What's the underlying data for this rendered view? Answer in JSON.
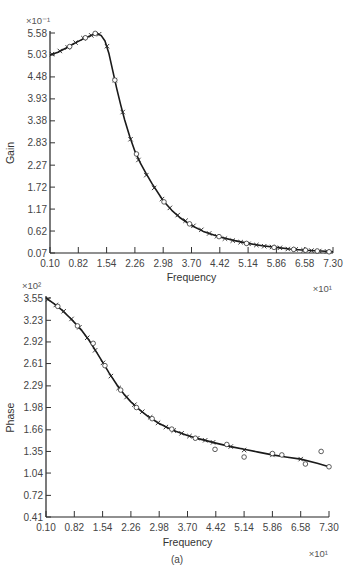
{
  "caption": "(a)",
  "chart_data": [
    {
      "type": "line",
      "title": "",
      "xlabel": "Frequency",
      "ylabel": "Gain",
      "x_multiplier": "×10¹",
      "y_multiplier": "×10⁻¹",
      "xlim": [
        0.1,
        7.3
      ],
      "ylim": [
        0.07,
        5.58
      ],
      "x_ticks": [
        "0.10",
        "0.82",
        "1.54",
        "2.26",
        "2.98",
        "3.70",
        "4.42",
        "5.14",
        "5.86",
        "6.58",
        "7.30"
      ],
      "y_ticks": [
        "0.07",
        "0.62",
        "1.17",
        "1.72",
        "2.27",
        "2.83",
        "3.38",
        "3.93",
        "4.48",
        "5.03",
        "5.58"
      ],
      "grid": false,
      "series": [
        {
          "name": "fitted curve",
          "style": "solid line",
          "x": [
            0.1,
            0.3,
            0.5,
            0.7,
            0.82,
            1.0,
            1.1,
            1.2,
            1.3,
            1.4,
            1.5,
            1.6,
            1.7,
            1.8,
            1.9,
            2.0,
            2.13,
            2.26,
            2.4,
            2.55,
            2.7,
            2.98,
            3.2,
            3.4,
            3.7,
            4.0,
            4.42,
            4.8,
            5.14,
            5.5,
            5.86,
            6.2,
            6.58,
            7.0,
            7.3
          ],
          "y": [
            5.03,
            5.1,
            5.2,
            5.31,
            5.37,
            5.46,
            5.5,
            5.54,
            5.56,
            5.52,
            5.38,
            5.06,
            4.62,
            4.18,
            3.78,
            3.4,
            2.98,
            2.62,
            2.32,
            2.05,
            1.8,
            1.38,
            1.14,
            0.96,
            0.76,
            0.61,
            0.47,
            0.38,
            0.31,
            0.25,
            0.21,
            0.17,
            0.14,
            0.12,
            0.1
          ]
        },
        {
          "name": "measured (x markers)",
          "style": "x markers",
          "x": [
            0.15,
            0.35,
            0.55,
            0.75,
            0.95,
            1.15,
            1.35,
            1.55,
            1.75,
            1.95,
            2.15,
            2.35,
            2.55,
            2.75,
            2.95,
            3.15,
            3.35,
            3.55,
            3.75,
            3.95,
            4.15,
            4.35,
            4.55,
            4.75,
            4.95,
            5.15,
            5.35,
            5.55,
            5.75,
            5.95,
            6.15,
            6.35,
            6.55,
            6.75,
            6.95,
            7.15
          ],
          "y": [
            5.05,
            5.13,
            5.22,
            5.34,
            5.45,
            5.52,
            5.55,
            5.25,
            4.4,
            3.6,
            2.92,
            2.4,
            2.02,
            1.7,
            1.42,
            1.2,
            1.02,
            0.88,
            0.75,
            0.65,
            0.56,
            0.49,
            0.43,
            0.38,
            0.34,
            0.3,
            0.27,
            0.24,
            0.22,
            0.2,
            0.17,
            0.16,
            0.14,
            0.13,
            0.12,
            0.11
          ]
        },
        {
          "name": "measured (o markers)",
          "style": "open circles",
          "x": [
            0.6,
            1.0,
            1.25,
            1.75,
            2.3,
            3.0,
            3.65,
            4.4,
            5.1,
            5.8,
            6.3,
            6.6,
            6.9,
            7.2
          ],
          "y": [
            5.24,
            5.46,
            5.57,
            4.4,
            2.55,
            1.35,
            0.8,
            0.48,
            0.31,
            0.21,
            0.16,
            0.14,
            0.12,
            0.1
          ]
        }
      ]
    },
    {
      "type": "line",
      "title": "",
      "xlabel": "Frequency",
      "ylabel": "Phase",
      "x_multiplier": "×10¹",
      "y_multiplier": "×10²",
      "xlim": [
        0.1,
        7.3
      ],
      "ylim": [
        0.41,
        3.55
      ],
      "x_ticks": [
        "0.10",
        "0.82",
        "1.54",
        "2.26",
        "2.98",
        "3.70",
        "4.42",
        "5.14",
        "5.86",
        "6.58",
        "7.30"
      ],
      "y_ticks": [
        "0.41",
        "0.72",
        "1.04",
        "1.35",
        "1.66",
        "1.98",
        "2.29",
        "2.61",
        "2.92",
        "3.23",
        "3.55"
      ],
      "grid": false,
      "series": [
        {
          "name": "fitted curve",
          "style": "solid line",
          "x": [
            0.1,
            0.3,
            0.5,
            0.7,
            0.82,
            1.0,
            1.2,
            1.4,
            1.54,
            1.7,
            1.9,
            2.1,
            2.26,
            2.5,
            2.7,
            2.98,
            3.2,
            3.4,
            3.7,
            4.0,
            4.42,
            4.8,
            5.14,
            5.5,
            5.86,
            6.2,
            6.58,
            7.0,
            7.3
          ],
          "y": [
            3.55,
            3.47,
            3.38,
            3.27,
            3.2,
            3.09,
            2.94,
            2.76,
            2.63,
            2.48,
            2.31,
            2.16,
            2.06,
            1.94,
            1.85,
            1.75,
            1.69,
            1.64,
            1.58,
            1.53,
            1.47,
            1.42,
            1.38,
            1.34,
            1.3,
            1.27,
            1.24,
            1.18,
            1.13
          ]
        },
        {
          "name": "measured (x markers)",
          "style": "x markers",
          "x": [
            0.15,
            0.35,
            0.55,
            0.75,
            0.95,
            1.15,
            1.35,
            1.55,
            1.75,
            1.95,
            2.15,
            2.35,
            2.55,
            2.75,
            2.95,
            3.15,
            3.35,
            3.55,
            3.75,
            3.95,
            4.15,
            4.35,
            4.8,
            5.14,
            5.86,
            6.58
          ],
          "y": [
            3.53,
            3.45,
            3.36,
            3.25,
            3.13,
            2.98,
            2.8,
            2.62,
            2.43,
            2.26,
            2.13,
            2.02,
            1.92,
            1.84,
            1.76,
            1.7,
            1.65,
            1.61,
            1.57,
            1.54,
            1.51,
            1.48,
            1.42,
            1.37,
            1.3,
            1.24
          ]
        },
        {
          "name": "measured (o markers)",
          "style": "open circles",
          "x": [
            0.4,
            0.9,
            1.3,
            1.6,
            2.0,
            2.4,
            2.8,
            3.3,
            3.9,
            4.4,
            4.7,
            5.14,
            5.86,
            6.1,
            6.7,
            7.1,
            7.3
          ],
          "y": [
            3.43,
            3.15,
            2.9,
            2.58,
            2.23,
            1.98,
            1.82,
            1.67,
            1.54,
            1.38,
            1.45,
            1.27,
            1.32,
            1.3,
            1.17,
            1.35,
            1.13
          ]
        }
      ]
    }
  ]
}
